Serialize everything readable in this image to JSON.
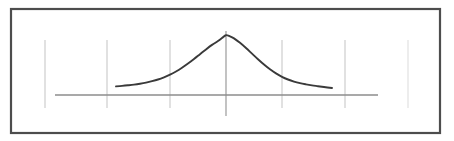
{
  "figure": {
    "title": "",
    "background_color": "#ffffff",
    "width": 454,
    "height": 141,
    "border": {
      "name": "figure-frame",
      "x": 11,
      "y": 9,
      "width": 429,
      "height": 124,
      "color": "#4d4d4d",
      "stroke_width": 2.2
    }
  },
  "chart_data": {
    "type": "line",
    "title": "",
    "subtitle": "",
    "xlabel": "",
    "ylabel": "",
    "legend": [],
    "legend_position": "none",
    "grid": true,
    "annotations": [],
    "axis": {
      "name": "x-axis-line",
      "color": "#8c8c8c",
      "stroke_width": 1.3,
      "y_pixel": 95,
      "x_start_pixel": 55,
      "x_end_pixel": 378
    },
    "gridlines": [
      {
        "name": "gridline-1",
        "x_pixel": 45,
        "y_top": 40,
        "y_bottom": 108,
        "color": "#c9c9c9",
        "stroke_width": 1.1,
        "emphasis": false
      },
      {
        "name": "gridline-2",
        "x_pixel": 107,
        "y_top": 40,
        "y_bottom": 108,
        "color": "#c9c9c9",
        "stroke_width": 1.1,
        "emphasis": false
      },
      {
        "name": "gridline-3",
        "x_pixel": 170,
        "y_top": 40,
        "y_bottom": 108,
        "color": "#c9c9c9",
        "stroke_width": 1.1,
        "emphasis": false
      },
      {
        "name": "gridline-center",
        "x_pixel": 226,
        "y_top": 31,
        "y_bottom": 116,
        "color": "#9a9a9a",
        "stroke_width": 1.2,
        "emphasis": true
      },
      {
        "name": "gridline-5",
        "x_pixel": 282,
        "y_top": 40,
        "y_bottom": 108,
        "color": "#c9c9c9",
        "stroke_width": 1.1,
        "emphasis": false
      },
      {
        "name": "gridline-6",
        "x_pixel": 345,
        "y_top": 40,
        "y_bottom": 108,
        "color": "#c9c9c9",
        "stroke_width": 1.1,
        "emphasis": false
      },
      {
        "name": "gridline-7",
        "x_pixel": 408,
        "y_top": 40,
        "y_bottom": 108,
        "color": "#dedede",
        "stroke_width": 1.1,
        "emphasis": false
      }
    ],
    "series": [
      {
        "name": "bell-curve",
        "kind": "gaussian",
        "color": "#3a3a3a",
        "stroke_width": 1.9,
        "mean_x_pixel": 226,
        "peak_y_pixel": 35,
        "baseline_y_pixel": 88,
        "sigma_pixel": 30,
        "x_start_pixel": 116,
        "x_end_pixel": 332,
        "points_pixel": [
          [
            116,
            86.4
          ],
          [
            122,
            85.9
          ],
          [
            128,
            85.3
          ],
          [
            134,
            84.6
          ],
          [
            140,
            83.7
          ],
          [
            146,
            82.6
          ],
          [
            152,
            81.2
          ],
          [
            158,
            79.5
          ],
          [
            164,
            77.3
          ],
          [
            170,
            74.7
          ],
          [
            176,
            71.5
          ],
          [
            182,
            67.8
          ],
          [
            188,
            63.6
          ],
          [
            194,
            59.0
          ],
          [
            200,
            54.2
          ],
          [
            206,
            49.4
          ],
          [
            212,
            44.9
          ],
          [
            218,
            41.0
          ],
          [
            222,
            38.0
          ],
          [
            226,
            35.2
          ],
          [
            230,
            36.4
          ],
          [
            234,
            38.4
          ],
          [
            240,
            42.8
          ],
          [
            246,
            48.0
          ],
          [
            252,
            53.6
          ],
          [
            258,
            59.2
          ],
          [
            264,
            64.5
          ],
          [
            270,
            69.3
          ],
          [
            276,
            73.4
          ],
          [
            282,
            76.8
          ],
          [
            288,
            79.5
          ],
          [
            294,
            81.6
          ],
          [
            300,
            83.2
          ],
          [
            306,
            84.4
          ],
          [
            312,
            85.4
          ],
          [
            318,
            86.2
          ],
          [
            324,
            87.0
          ],
          [
            332,
            88.0
          ]
        ]
      }
    ]
  }
}
